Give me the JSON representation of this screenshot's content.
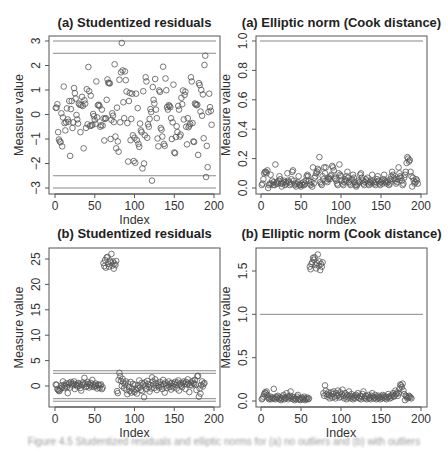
{
  "chart_data": [
    {
      "id": "a-studentized",
      "type": "scatter",
      "title": "(a) Studentized residuals",
      "xlabel": "Index",
      "ylabel": "Measure value",
      "xlim": [
        0,
        200
      ],
      "ylim": [
        -3,
        3
      ],
      "xticks": [
        "0",
        "50",
        "100",
        "150",
        "200"
      ],
      "yticks": [
        "-3",
        "-2",
        "-1",
        "0",
        "1",
        "2",
        "3"
      ],
      "hlines": [
        3,
        2.5,
        -2.5,
        -3
      ],
      "x": "1..200",
      "values": [
        0.27,
        0.28,
        0.42,
        -0.72,
        -1.02,
        -1.1,
        -1.13,
        0.05,
        -1.3,
        -0.12,
        1.14,
        -0.35,
        -0.65,
        -0.32,
        0.25,
        -0.2,
        -0.3,
        0.55,
        -1.69,
        0.22,
        0.55,
        -0.55,
        -0.32,
        1.08,
        0.87,
        0.65,
        -0.02,
        -0.2,
        -0.37,
        0.45,
        0.4,
        -0.72,
        0.38,
        0.72,
        0.35,
        -1.38,
        0.58,
        0.44,
        -0.55,
        1.03,
        -0.4,
        1.94,
        0.95,
        -0.47,
        0.77,
        -0.45,
        -0.42,
        0.02,
        -0.07,
        -0.22,
        -0.38,
        1.35,
        -0.12,
        0.38,
        0.4,
        0.35,
        -0.5,
        -0.44,
        0.2,
        -0.45,
        -0.16,
        -1.06,
        -0.18,
        -0.15,
        0.6,
        1.43,
        1.3,
        1.28,
        1.27,
        -1.0,
        -0.22,
        0.05,
        -0.05,
        -0.31,
        2.05,
        -0.9,
        -1.38,
        0.28,
        -1.1,
        -1.52,
        1.42,
        -0.32,
        1.72,
        2.92,
        1.8,
        0.5,
        -0.15,
        1.76,
        1.4,
        0.94,
        -0.35,
        -1.92,
        0.55,
        0.88,
        -1.05,
        -0.18,
        0.85,
        -0.85,
        -1.9,
        -0.95,
        -1.97,
        0.85,
        -1.05,
        0.26,
        -1.2,
        -1.32,
        -0.37,
        -0.65,
        -0.72,
        -2.2,
        0.95,
        -2.0,
        -0.85,
        1.52,
        1.35,
        -0.95,
        -0.4,
        -0.5,
        -0.18,
        0.22,
        0.1,
        -2.7,
        1.12,
        0.6,
        0.45,
        1.45,
        0.2,
        -0.15,
        -0.98,
        -1.3,
        0.98,
        0.92,
        -0.55,
        -0.62,
        -0.9,
        1.95,
        -1.2,
        -1.28,
        1.47,
        0.99,
        0.3,
        0.2,
        0.38,
        0.35,
        0.3,
        -0.15,
        -1.0,
        -0.32,
        1.22,
        -1.55,
        -1.58,
        -0.92,
        -0.48,
        -0.72,
        0.35,
        0.2,
        -0.9,
        -0.82,
        0.68,
        0.42,
        0.98,
        -0.2,
        0.8,
        0.93,
        -0.5,
        -1.22,
        -0.15,
        -0.52,
        -0.45,
        -0.38,
        1.52,
        1.35,
        -0.35,
        -1.1,
        -1.12,
        0.45,
        0.42,
        0.38,
        0.4,
        -1.65,
        1.28,
        1.2,
        0.12,
        1.0,
        -0.05,
        0.82,
        -0.97,
        2.02,
        2.4,
        -2.55,
        -1.28,
        -2.15,
        0.1,
        0.85,
        0.3,
        0.15,
        -0.42
      ]
    },
    {
      "id": "a-elliptic",
      "type": "scatter",
      "title": "(a) Elliptic norm (Cook distance)",
      "xlabel": "Index",
      "ylabel": "Measure value",
      "xlim": [
        0,
        200
      ],
      "ylim": [
        0,
        1.0
      ],
      "xticks": [
        "0",
        "50",
        "100",
        "150",
        "200"
      ],
      "yticks": [
        "0.0",
        "0.2",
        "0.4",
        "0.6",
        "0.8",
        "1.0"
      ],
      "hlines": [
        1.0
      ],
      "x": "1..200",
      "values": [
        0.02,
        0.03,
        0.06,
        0.1,
        0.11,
        0.11,
        0.1,
        0.12,
        0.0,
        0.02,
        0.03,
        0.09,
        0.03,
        0.05,
        0.02,
        0.04,
        0.02,
        0.16,
        0.03,
        0.04,
        0.03,
        0.05,
        0.08,
        0.06,
        0.03,
        0.01,
        0.03,
        0.04,
        0.05,
        0.02,
        0.04,
        0.03,
        0.1,
        0.05,
        0.04,
        0.02,
        0.03,
        0.06,
        0.11,
        0.12,
        0.05,
        0.02,
        0.03,
        0.01,
        0.03,
        0.04,
        0.08,
        0.02,
        0.02,
        0.01,
        0.03,
        0.02,
        0.04,
        0.02,
        0.03,
        0.05,
        0.08,
        0.09,
        0.08,
        0.05,
        0.03,
        0.02,
        0.04,
        0.01,
        0.14,
        0.03,
        0.07,
        0.08,
        0.1,
        0.11,
        0.13,
        0.12,
        0.21,
        0.04,
        0.03,
        0.02,
        0.08,
        0.06,
        0.14,
        0.1,
        0.14,
        0.05,
        0.04,
        0.06,
        0.07,
        0.06,
        0.08,
        0.09,
        0.15,
        0.14,
        0.12,
        0.07,
        0.06,
        0.05,
        0.03,
        0.02,
        0.1,
        0.16,
        0.09,
        0.08,
        0.05,
        0.03,
        0.02,
        0.04,
        0.06,
        0.05,
        0.08,
        0.11,
        0.07,
        0.04,
        0.03,
        0.02,
        0.05,
        0.06,
        0.09,
        0.07,
        0.04,
        0.02,
        0.01,
        0.02,
        0.03,
        0.05,
        0.04,
        0.09,
        0.1,
        0.07,
        0.05,
        0.03,
        0.02,
        0.04,
        0.06,
        0.05,
        0.07,
        0.03,
        0.02,
        0.04,
        0.05,
        0.03,
        0.09,
        0.05,
        0.04,
        0.03,
        0.02,
        0.04,
        0.06,
        0.08,
        0.05,
        0.03,
        0.02,
        0.04,
        0.05,
        0.03,
        0.06,
        0.09,
        0.05,
        0.04,
        0.03,
        0.05,
        0.04,
        0.02,
        0.03,
        0.06,
        0.08,
        0.11,
        0.09,
        0.07,
        0.06,
        0.05,
        0.03,
        0.04,
        0.06,
        0.14,
        0.1,
        0.08,
        0.07,
        0.05,
        0.02,
        0.03,
        0.07,
        0.09,
        0.11,
        0.17,
        0.21,
        0.2,
        0.18,
        0.19,
        0.11,
        0.08,
        0.01,
        0.07,
        0.05,
        0.03,
        0.04,
        0.06,
        0.05,
        0.03
      ]
    },
    {
      "id": "b-studentized",
      "type": "scatter",
      "title": "(b) Studentized residuals",
      "xlabel": "Index",
      "ylabel": "Measure value",
      "xlim": [
        0,
        200
      ],
      "ylim": [
        -3.5,
        26
      ],
      "xticks": [
        "0",
        "50",
        "100",
        "150",
        "200"
      ],
      "yticks": [
        "0",
        "5",
        "10",
        "15",
        "20",
        "25"
      ],
      "hlines": [
        3,
        2.5,
        -2.5,
        -3
      ],
      "x": "1..200",
      "values": [
        0.3,
        0.2,
        -0.6,
        -0.8,
        -1.0,
        -0.9,
        -0.5,
        0.1,
        -0.3,
        0.9,
        0.2,
        -0.4,
        0.0,
        0.5,
        -0.2,
        -1.4,
        0.3,
        0.6,
        -0.3,
        0.8,
        0.4,
        0.1,
        0.5,
        0.9,
        -0.6,
        0.3,
        0.2,
        -0.1,
        0.6,
        0.1,
        0.4,
        -0.4,
        -0.9,
        0.2,
        0.7,
        0.3,
        1.6,
        0.5,
        -0.2,
        0.0,
        0.8,
        0.4,
        -0.3,
        0.2,
        0.6,
        -0.1,
        1.2,
        0.3,
        -0.2,
        0.1,
        0.5,
        0.0,
        -0.5,
        0.3,
        0.2,
        -0.4,
        0.1,
        0.3,
        -0.6,
        -0.3,
        24.2,
        23.6,
        24.8,
        23.3,
        25.3,
        25.4,
        24.0,
        23.5,
        24.7,
        24.3,
        26.0,
        23.7,
        24.5,
        23.1,
        24.1,
        23.8,
        24.6,
        -1.0,
        -1.4,
        1.2,
        2.6,
        1.9,
        1.0,
        0.0,
        1.4,
        0.7,
        -0.4,
        0.3,
        0.9,
        -0.8,
        -1.6,
        0.5,
        -0.2,
        -1.0,
        0.8,
        -1.3,
        -0.5,
        0.4,
        -0.9,
        -1.2,
        0.2,
        -0.7,
        -1.5,
        -0.4,
        0.1,
        1.1,
        -0.3,
        -0.8,
        0.6,
        -1.0,
        0.3,
        -2.2,
        0.7,
        0.1,
        -0.6,
        1.0,
        0.4,
        -0.2,
        -1.1,
        0.2,
        -0.5,
        1.7,
        0.9,
        0.3,
        -0.4,
        1.3,
        0.6,
        -0.8,
        0.0,
        0.5,
        -0.3,
        0.8,
        0.2,
        -0.1,
        -0.6,
        1.2,
        0.4,
        -1.3,
        0.7,
        0.1,
        -0.4,
        0.3,
        0.9,
        -0.2,
        0.5,
        -0.7,
        0.6,
        0.0,
        -0.3,
        0.4,
        0.8,
        0.2,
        -0.5,
        0.7,
        1.1,
        -0.9,
        0.3,
        0.5,
        0.1,
        -0.2,
        0.6,
        0.9,
        0.4,
        -0.6,
        0.8,
        0.3,
        1.3,
        0.5,
        -1.2,
        0.2,
        0.7,
        0.1,
        1.0,
        0.6,
        0.4,
        1.2,
        0.3,
        -0.8,
        1.9,
        2.0,
        -2.1,
        -0.5,
        -1.5,
        0.2,
        0.9,
        -0.1,
        0.4,
        0.6
      ]
    },
    {
      "id": "b-elliptic",
      "type": "scatter",
      "title": "(b) Elliptic norm (Cook distance)",
      "xlabel": "Index",
      "ylabel": "Measure value",
      "xlim": [
        0,
        200
      ],
      "ylim": [
        0,
        1.75
      ],
      "xticks": [
        "0",
        "50",
        "100",
        "150",
        "200"
      ],
      "yticks": [
        "0.0",
        "0.5",
        "1.0",
        "1.5"
      ],
      "hlines": [
        1.0
      ],
      "x": "1..200",
      "values": [
        0.02,
        0.03,
        0.05,
        0.08,
        0.1,
        0.09,
        0.11,
        0.07,
        0.04,
        0.02,
        0.03,
        0.05,
        0.02,
        0.04,
        0.03,
        0.14,
        0.03,
        0.02,
        0.05,
        0.04,
        0.06,
        0.03,
        0.02,
        0.04,
        0.01,
        0.03,
        0.05,
        0.07,
        0.02,
        0.04,
        0.03,
        0.09,
        0.05,
        0.02,
        0.04,
        0.06,
        0.11,
        0.03,
        0.05,
        0.02,
        0.04,
        0.01,
        0.03,
        0.02,
        0.05,
        0.07,
        0.02,
        0.03,
        0.01,
        0.02,
        0.04,
        0.03,
        0.02,
        0.05,
        0.01,
        0.03,
        0.02,
        0.04,
        0.02,
        0.03,
        1.55,
        1.52,
        1.58,
        1.6,
        1.65,
        1.63,
        1.66,
        1.57,
        1.53,
        1.59,
        1.69,
        1.56,
        1.61,
        1.51,
        1.58,
        1.55,
        1.6,
        0.09,
        0.06,
        0.18,
        0.12,
        0.08,
        0.05,
        0.1,
        0.07,
        0.03,
        0.06,
        0.1,
        0.04,
        0.08,
        0.11,
        0.05,
        0.03,
        0.09,
        0.06,
        0.12,
        0.07,
        0.04,
        0.1,
        0.05,
        0.08,
        0.13,
        0.06,
        0.03,
        0.09,
        0.05,
        0.02,
        0.07,
        0.04,
        0.11,
        0.06,
        0.03,
        0.08,
        0.05,
        0.02,
        0.04,
        0.06,
        0.03,
        0.07,
        0.05,
        0.09,
        0.04,
        0.03,
        0.06,
        0.02,
        0.05,
        0.08,
        0.11,
        0.04,
        0.03,
        0.06,
        0.02,
        0.05,
        0.07,
        0.03,
        0.04,
        0.02,
        0.06,
        0.09,
        0.05,
        0.03,
        0.04,
        0.07,
        0.02,
        0.05,
        0.03,
        0.06,
        0.04,
        0.02,
        0.05,
        0.03,
        0.07,
        0.04,
        0.06,
        0.03,
        0.05,
        0.02,
        0.04,
        0.08,
        0.05,
        0.03,
        0.06,
        0.04,
        0.07,
        0.09,
        0.05,
        0.06,
        0.12,
        0.08,
        0.1,
        0.06,
        0.09,
        0.14,
        0.19,
        0.18,
        0.16,
        0.2,
        0.12,
        0.08,
        0.01,
        0.06,
        0.05,
        0.03,
        0.04,
        0.06,
        0.05,
        0.04,
        0.03
      ]
    }
  ],
  "caption": "Figure 4.5 Studentized residuals and elliptic norms for (a) no outliers and (b) with outliers"
}
